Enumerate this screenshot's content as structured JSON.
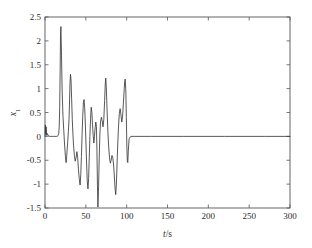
{
  "chart_data": {
    "type": "line",
    "title": "",
    "subtitle": "",
    "xlabel": "t/s",
    "xlabel_italic_part": "t",
    "xlabel_rest": "/s",
    "ylabel": "x1",
    "ylabel_italic_part": "x",
    "ylabel_subscript": "1",
    "grid": false,
    "legend": null,
    "legend_position": "none",
    "xlim": [
      0,
      300
    ],
    "ylim": [
      -1.5,
      2.5
    ],
    "xticks": [
      0,
      50,
      100,
      150,
      200,
      250,
      300
    ],
    "xticklabels": [
      "0",
      "50",
      "100",
      "150",
      "200",
      "250",
      "300"
    ],
    "yticks": [
      -1.5,
      -1,
      -0.5,
      0,
      0.5,
      1,
      1.5,
      2,
      2.5
    ],
    "yticklabels": [
      "-1.5",
      "-1",
      "-0.5",
      "0",
      "0.5",
      "1",
      "1.5",
      "2",
      "2.5"
    ],
    "line_color": "#3a3a3a",
    "background_color": "#ffffff",
    "axis_color": "#555555",
    "series": [
      {
        "name": "x1",
        "x": [
          0,
          0.4,
          0.9,
          1.4,
          2.0,
          2.8,
          4.0,
          6.0,
          9.0,
          12.0,
          14.0,
          15.2,
          16.0,
          16.8,
          17.4,
          18.0,
          18.6,
          19.0,
          19.5,
          20.2,
          21.0,
          22.0,
          23.0,
          24.0,
          25.0,
          25.8,
          26.4,
          27.0,
          27.8,
          28.6,
          29.4,
          30.0,
          30.6,
          31.2,
          31.8,
          32.6,
          33.4,
          34.2,
          35.0,
          36.0,
          37.0,
          38.0,
          39.0,
          40.0,
          41.0,
          42.0,
          43.0,
          43.8,
          44.6,
          45.4,
          46.2,
          47.0,
          47.8,
          48.6,
          49.4,
          50.2,
          51.0,
          51.8,
          52.6,
          53.4,
          54.2,
          55.0,
          55.8,
          56.6,
          57.4,
          58.2,
          59.0,
          59.8,
          60.6,
          61.4,
          62.2,
          63.0,
          63.6,
          64.2,
          64.8,
          65.6,
          66.4,
          67.2,
          68.0,
          69.0,
          70.0,
          71.0,
          72.0,
          73.0,
          73.8,
          74.4,
          75.0,
          76.0,
          77.0,
          78.0,
          79.0,
          80.0,
          81.0,
          82.0,
          83.0,
          84.0,
          85.0,
          85.8,
          86.6,
          87.4,
          88.2,
          89.0,
          90.0,
          91.0,
          92.0,
          93.0,
          94.0,
          95.0,
          96.0,
          97.0,
          97.6,
          98.2,
          99.0,
          99.6,
          100.2,
          100.8,
          101.4,
          102.0,
          103.0,
          105.0,
          110.0,
          130.0,
          170.0,
          220.0,
          270.0,
          300.0
        ],
        "values": [
          0.0,
          0.24,
          0.05,
          0.2,
          0.02,
          0.06,
          0.01,
          0.0,
          0.0,
          0.0,
          0.0,
          0.0,
          0.02,
          0.06,
          0.2,
          0.6,
          1.45,
          2.15,
          2.3,
          1.7,
          0.95,
          0.42,
          0.12,
          -0.18,
          -0.42,
          -0.55,
          -0.47,
          -0.3,
          -0.12,
          0.1,
          0.35,
          0.72,
          1.1,
          1.3,
          1.2,
          0.8,
          0.36,
          0.04,
          -0.2,
          -0.4,
          -0.52,
          -0.45,
          -0.32,
          -0.44,
          -0.7,
          -0.9,
          -1.02,
          -0.8,
          -0.42,
          0.04,
          0.42,
          0.7,
          0.77,
          0.6,
          0.26,
          -0.18,
          -0.6,
          -0.95,
          -1.1,
          -0.88,
          -0.45,
          0.0,
          0.38,
          0.61,
          0.5,
          0.24,
          0.02,
          -0.14,
          0.0,
          0.18,
          0.3,
          0.2,
          -0.3,
          -1.0,
          -1.48,
          -1.05,
          -0.45,
          0.05,
          0.3,
          0.4,
          0.33,
          0.2,
          0.35,
          0.75,
          1.1,
          1.22,
          1.05,
          0.55,
          0.1,
          -0.22,
          -0.45,
          -0.56,
          -0.5,
          -0.4,
          -0.44,
          -0.6,
          -0.85,
          -1.1,
          -1.22,
          -1.0,
          -0.6,
          -0.2,
          0.2,
          0.48,
          0.58,
          0.45,
          0.3,
          0.42,
          0.7,
          1.0,
          1.15,
          1.2,
          0.95,
          0.4,
          -0.2,
          -0.52,
          -0.55,
          -0.3,
          -0.05,
          0.0,
          0.0,
          0.0,
          0.0,
          0.0,
          0.0,
          0.0
        ]
      }
    ],
    "annotations": []
  },
  "figure": {
    "plot_area": {
      "left": 45,
      "top": 17,
      "right": 290,
      "bottom": 208
    }
  }
}
